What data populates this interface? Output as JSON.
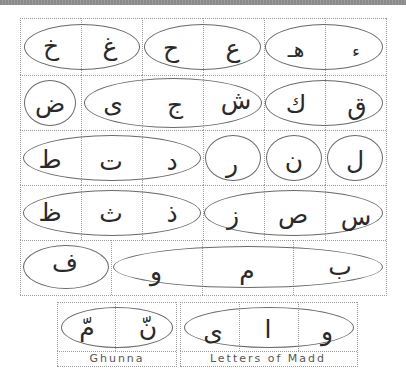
{
  "colors": {
    "grid_line": "#9a9a9a",
    "oval_stroke": "#6a6a6a",
    "letter": "#2a2a2a",
    "caption": "#555555",
    "top_band": "#8a8a8a"
  },
  "main_chart": {
    "rows": [
      {
        "groups": [
          {
            "letters": [
              "خ",
              "غ"
            ]
          },
          {
            "letters": [
              "ح",
              "ع"
            ]
          },
          {
            "letters": [
              "هـ",
              "ء"
            ]
          }
        ]
      },
      {
        "groups": [
          {
            "letters": [
              "ض"
            ]
          },
          {
            "letters": [
              "ى",
              "ج",
              "ش"
            ]
          },
          {
            "letters": [
              "ك",
              "ق"
            ]
          }
        ]
      },
      {
        "groups": [
          {
            "letters": [
              "ط",
              "ت",
              "د"
            ]
          },
          {
            "letters": [
              "ر"
            ]
          },
          {
            "letters": [
              "ن"
            ]
          },
          {
            "letters": [
              "ل"
            ]
          }
        ]
      },
      {
        "groups": [
          {
            "letters": [
              "ظ",
              "ث",
              "ذ"
            ]
          },
          {
            "letters": [
              "ز",
              "ص",
              "س"
            ]
          }
        ]
      },
      {
        "groups": [
          {
            "letters": [
              "ف"
            ]
          },
          {
            "letters": [
              "و",
              "م",
              "ب"
            ]
          }
        ]
      }
    ]
  },
  "ghunna": {
    "letters": [
      "مّ",
      "نّ"
    ],
    "label": "Ghunna"
  },
  "madd": {
    "letters": [
      "ى",
      "ا",
      "و"
    ],
    "label": "Letters of Madd"
  }
}
